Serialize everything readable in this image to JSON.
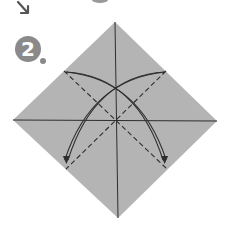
{
  "diagram": {
    "type": "origami-instruction-step",
    "step": {
      "number": "2"
    },
    "colors": {
      "background": "#ffffff",
      "paper": "#b4b4b4",
      "badge": "#8a8a8a",
      "badge_text": "#ffffff",
      "line": "#2e2e2e",
      "prev_arrow": "#555555",
      "prev_shape": "#9a9a9a"
    },
    "paper_square": {
      "vertices": {
        "top": [
          115,
          22
        ],
        "right": [
          217,
          121
        ],
        "bottom": [
          118,
          218
        ],
        "left": [
          13,
          120
        ]
      },
      "center": [
        116,
        120
      ]
    },
    "creases": [
      {
        "id": "vertical",
        "style": "solid",
        "from": [
          115,
          22
        ],
        "to": [
          118,
          218
        ]
      },
      {
        "id": "horizontal",
        "style": "solid",
        "from": [
          13,
          120
        ],
        "to": [
          217,
          121
        ]
      },
      {
        "id": "diag-a",
        "style": "dashed",
        "from": [
          64,
          71
        ],
        "to": [
          167,
          169
        ]
      },
      {
        "id": "diag-b",
        "style": "dashed",
        "from": [
          166,
          71
        ],
        "to": [
          66,
          169
        ]
      }
    ],
    "arrows": [
      {
        "id": "fold-arrow-right",
        "direction": "upper-left to lower-right",
        "start": [
          66,
          72
        ],
        "end": [
          163,
          160
        ]
      },
      {
        "id": "fold-arrow-left",
        "direction": "upper-right to lower-left",
        "start": [
          165,
          72
        ],
        "end": [
          68,
          160
        ]
      }
    ],
    "previous_step_fragments": [
      {
        "id": "prev-arrow",
        "kind": "arrow",
        "position": [
          22,
          8
        ]
      },
      {
        "id": "prev-shape",
        "kind": "shape-fragment",
        "position": [
          97,
          0
        ]
      }
    ]
  }
}
